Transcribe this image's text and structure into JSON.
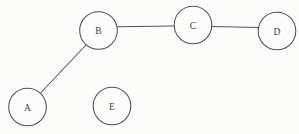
{
  "diagram": {
    "type": "node-link-graph",
    "width": 299,
    "height": 134,
    "background_color": "#fcfcfb",
    "stroke_color": "#4f4f57",
    "label_color": "#3b3b41",
    "nodes": [
      {
        "id": "A",
        "label": "A",
        "cx": 27.5,
        "cy": 107.0,
        "r": 18.8
      },
      {
        "id": "B",
        "label": "B",
        "cx": 98.5,
        "cy": 30.5,
        "r": 18.8
      },
      {
        "id": "C",
        "label": "C",
        "cx": 193.0,
        "cy": 25.0,
        "r": 18.8
      },
      {
        "id": "D",
        "label": "D",
        "cx": 277.0,
        "cy": 31.0,
        "r": 18.8
      },
      {
        "id": "E",
        "label": "E",
        "cx": 112.0,
        "cy": 106.0,
        "r": 18.8
      }
    ],
    "edges": [
      {
        "from": "A",
        "to": "B",
        "x1": 41.0,
        "y1": 92.5,
        "x2": 85.5,
        "y2": 45.5
      },
      {
        "from": "B",
        "to": "C",
        "x1": 117.3,
        "y1": 26.8,
        "x2": 174.2,
        "y2": 26.0
      },
      {
        "from": "C",
        "to": "D",
        "x1": 211.8,
        "y1": 26.6,
        "x2": 258.2,
        "y2": 27.6
      }
    ],
    "isolated_nodes": [
      "E"
    ]
  }
}
